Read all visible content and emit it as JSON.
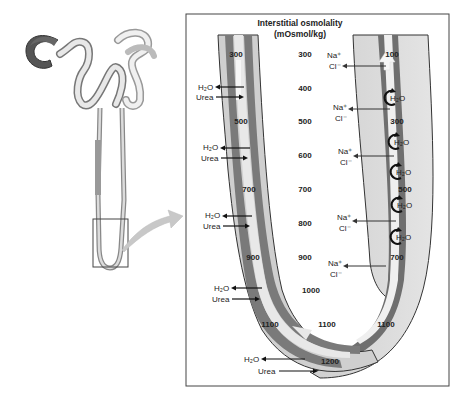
{
  "title": {
    "line1": "Interstitial osmolality",
    "line2": "(mOsmol/kg)"
  },
  "interstitial_values": [
    {
      "label": "300",
      "x": 305,
      "y": 57
    },
    {
      "label": "400",
      "x": 305,
      "y": 91
    },
    {
      "label": "500",
      "x": 305,
      "y": 124
    },
    {
      "label": "600",
      "x": 305,
      "y": 158
    },
    {
      "label": "700",
      "x": 305,
      "y": 192
    },
    {
      "label": "800",
      "x": 305,
      "y": 226
    },
    {
      "label": "900",
      "x": 305,
      "y": 260
    },
    {
      "label": "1000",
      "x": 311,
      "y": 293
    },
    {
      "label": "1100",
      "x": 327,
      "y": 327
    }
  ],
  "descending_limb_values": [
    {
      "label": "300",
      "x": 236,
      "y": 57
    },
    {
      "label": "500",
      "x": 241,
      "y": 124
    },
    {
      "label": "700",
      "x": 249,
      "y": 192
    },
    {
      "label": "900",
      "x": 253,
      "y": 260
    },
    {
      "label": "1100",
      "x": 270,
      "y": 327
    },
    {
      "label": "1200",
      "x": 330,
      "y": 364
    }
  ],
  "ascending_limb_values": [
    {
      "label": "100",
      "x": 392,
      "y": 57
    },
    {
      "label": "300",
      "x": 397,
      "y": 124
    },
    {
      "label": "500",
      "x": 405,
      "y": 192
    },
    {
      "label": "700",
      "x": 397,
      "y": 260
    },
    {
      "label": "1100",
      "x": 386,
      "y": 327
    }
  ],
  "descending_transport": [
    {
      "h2o": "H₂O",
      "urea": "Urea",
      "y": 88
    },
    {
      "h2o": "H₂O",
      "urea": "Urea",
      "y": 150
    },
    {
      "h2o": "H₂O",
      "urea": "Urea",
      "y": 218
    },
    {
      "h2o": "H₂O",
      "urea": "Urea",
      "y": 290
    },
    {
      "h2o": "H₂O",
      "urea": "Urea",
      "y": 358
    }
  ],
  "ascending_transport": [
    {
      "na": "Na⁺",
      "cl": "Cl⁻",
      "y": 58
    },
    {
      "na": "Na⁺",
      "cl": "Cl⁻",
      "y": 110
    },
    {
      "na": "Na⁺",
      "cl": "Cl⁻",
      "y": 154
    },
    {
      "na": "Na⁺",
      "cl": "Cl⁻",
      "y": 220
    },
    {
      "na": "Na⁺",
      "cl": "Cl⁻",
      "y": 266
    }
  ],
  "water_circles": [
    {
      "label": "H₂O",
      "y": 98
    },
    {
      "label": "H₂O",
      "y": 142
    },
    {
      "label": "H₂O",
      "y": 172
    },
    {
      "label": "H₂O",
      "y": 205
    },
    {
      "label": "H₂O",
      "y": 237
    }
  ],
  "colors": {
    "tube_outer": "#c8c8c8",
    "tube_band": "#7a7a7a",
    "tube_light": "#dedede",
    "lumen": "#a8a8a8",
    "border": "#333333",
    "arrow": "#111111",
    "flow_arrow": "#f2f2f2"
  }
}
